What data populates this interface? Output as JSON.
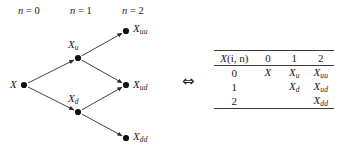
{
  "figure": {
    "type": "recombining-binomial-lattice",
    "equivalence_symbol": "⇔",
    "stage_labels": [
      {
        "text": "n = 0",
        "var": "n",
        "value": "0"
      },
      {
        "text": "n = 1",
        "var": "n",
        "value": "1"
      },
      {
        "text": "n = 2",
        "var": "n",
        "value": "2"
      }
    ],
    "nodes": [
      {
        "id": "root",
        "base": "X",
        "sub": "",
        "x": 24,
        "y": 85,
        "label_x": 10,
        "label_y": 85
      },
      {
        "id": "up",
        "base": "X",
        "sub": "u",
        "x": 78,
        "y": 58,
        "label_x": 68,
        "label_y": 45
      },
      {
        "id": "down",
        "base": "X",
        "sub": "d",
        "x": 78,
        "y": 112,
        "label_x": 68,
        "label_y": 99
      },
      {
        "id": "upup",
        "base": "X",
        "sub": "uu",
        "x": 126,
        "y": 31,
        "label_x": 133,
        "label_y": 29
      },
      {
        "id": "updown",
        "base": "X",
        "sub": "ud",
        "x": 126,
        "y": 85,
        "label_x": 133,
        "label_y": 85
      },
      {
        "id": "downdown",
        "base": "X",
        "sub": "dd",
        "x": 126,
        "y": 138,
        "label_x": 133,
        "label_y": 137
      }
    ],
    "edges": [
      {
        "from": "root",
        "to": "up"
      },
      {
        "from": "root",
        "to": "down"
      },
      {
        "from": "up",
        "to": "upup"
      },
      {
        "from": "up",
        "to": "updown"
      },
      {
        "from": "down",
        "to": "updown"
      },
      {
        "from": "down",
        "to": "downdown"
      }
    ],
    "stroke_color": "#2b2b2b",
    "node_color": "#111111"
  },
  "table": {
    "corner_header": "X(i, n)",
    "corner_header_base": "X",
    "corner_header_args": "(i, n)",
    "column_headers": [
      "0",
      "1",
      "2"
    ],
    "row_headers": [
      "0",
      "1",
      "2"
    ],
    "cells": [
      [
        {
          "base": "X",
          "sub": ""
        },
        {
          "base": "X",
          "sub": "u"
        },
        {
          "base": "X",
          "sub": "uu"
        }
      ],
      [
        {
          "base": "",
          "sub": ""
        },
        {
          "base": "X",
          "sub": "d"
        },
        {
          "base": "X",
          "sub": "ud"
        }
      ],
      [
        {
          "base": "",
          "sub": ""
        },
        {
          "base": "",
          "sub": ""
        },
        {
          "base": "X",
          "sub": "dd"
        }
      ]
    ]
  }
}
